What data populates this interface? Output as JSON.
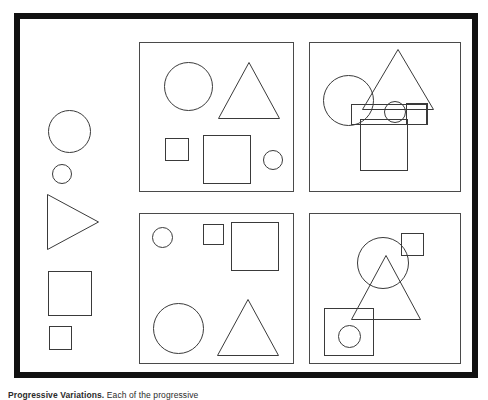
{
  "figure": {
    "title": "Progressive Variations",
    "caption_title": "Progressive Variations.",
    "caption_body": " Each of the progressive",
    "frame_color": "#111111",
    "shape_stroke_color": "#3a3a3a",
    "panel_border_color": "#4a4a4a",
    "background_color": "#ffffff",
    "frame": {
      "label": "outer-frame"
    },
    "key_column": {
      "label": "Shape vocabulary key",
      "shapes": [
        {
          "name": "large-circle",
          "type": "circle",
          "x": 28,
          "y": 68,
          "w": 43,
          "h": 43
        },
        {
          "name": "small-circle",
          "type": "circle",
          "x": 32,
          "y": 122,
          "w": 20,
          "h": 20
        },
        {
          "name": "right-triangle",
          "type": "triangle",
          "x": 27,
          "y": 152,
          "w": 52,
          "h": 56,
          "direction": "right"
        },
        {
          "name": "large-square",
          "type": "square",
          "x": 28,
          "y": 229,
          "w": 44,
          "h": 45
        },
        {
          "name": "small-square",
          "type": "square",
          "x": 29,
          "y": 284,
          "w": 23,
          "h": 24
        }
      ]
    },
    "panels": [
      {
        "name": "panel-top-left",
        "position": "top-left",
        "arrangement": "separated",
        "shapes": [
          {
            "name": "large-circle",
            "type": "circle",
            "x": 24,
            "y": 19,
            "w": 49,
            "h": 49
          },
          {
            "name": "large-triangle",
            "type": "triangle",
            "x": 78,
            "y": 19,
            "w": 62,
            "h": 57,
            "direction": "up"
          },
          {
            "name": "small-square",
            "type": "square",
            "x": 25,
            "y": 95,
            "w": 24,
            "h": 23
          },
          {
            "name": "large-square",
            "type": "square",
            "x": 63,
            "y": 92,
            "w": 48,
            "h": 49
          },
          {
            "name": "small-circle",
            "type": "circle",
            "x": 123,
            "y": 107,
            "w": 20,
            "h": 20
          }
        ]
      },
      {
        "name": "panel-top-right",
        "position": "top-right",
        "arrangement": "overlapping",
        "shapes": [
          {
            "name": "large-circle",
            "type": "circle",
            "x": 13,
            "y": 32,
            "w": 51,
            "h": 51
          },
          {
            "name": "large-triangle",
            "type": "triangle",
            "x": 52,
            "y": 6,
            "w": 72,
            "h": 61,
            "direction": "up"
          },
          {
            "name": "wide-rectangle",
            "type": "square",
            "x": 41,
            "y": 61,
            "w": 76,
            "h": 21
          },
          {
            "name": "small-circle",
            "type": "circle",
            "x": 74,
            "y": 58,
            "w": 22,
            "h": 22
          },
          {
            "name": "small-square",
            "type": "square",
            "x": 96,
            "y": 60,
            "w": 22,
            "h": 22
          },
          {
            "name": "large-square",
            "type": "square",
            "x": 50,
            "y": 76,
            "w": 48,
            "h": 52
          }
        ]
      },
      {
        "name": "panel-bottom-left",
        "position": "bottom-left",
        "arrangement": "separated",
        "shapes": [
          {
            "name": "small-circle",
            "type": "circle",
            "x": 12,
            "y": 13,
            "w": 21,
            "h": 21
          },
          {
            "name": "small-square",
            "type": "square",
            "x": 63,
            "y": 10,
            "w": 21,
            "h": 21
          },
          {
            "name": "large-square",
            "type": "square",
            "x": 91,
            "y": 8,
            "w": 48,
            "h": 49
          },
          {
            "name": "large-circle",
            "type": "circle",
            "x": 13,
            "y": 89,
            "w": 51,
            "h": 51
          },
          {
            "name": "large-triangle",
            "type": "triangle",
            "x": 77,
            "y": 85,
            "w": 62,
            "h": 57,
            "direction": "up"
          }
        ]
      },
      {
        "name": "panel-bottom-right",
        "position": "bottom-right",
        "arrangement": "overlapping",
        "shapes": [
          {
            "name": "large-circle",
            "type": "circle",
            "x": 47,
            "y": 23,
            "w": 52,
            "h": 52
          },
          {
            "name": "small-square",
            "type": "square",
            "x": 91,
            "y": 19,
            "w": 23,
            "h": 23
          },
          {
            "name": "large-triangle",
            "type": "triangle",
            "x": 41,
            "y": 41,
            "w": 70,
            "h": 65,
            "direction": "up"
          },
          {
            "name": "large-square",
            "type": "square",
            "x": 14,
            "y": 94,
            "w": 50,
            "h": 48
          },
          {
            "name": "small-circle",
            "type": "circle",
            "x": 28,
            "y": 111,
            "w": 23,
            "h": 23
          }
        ]
      }
    ]
  }
}
